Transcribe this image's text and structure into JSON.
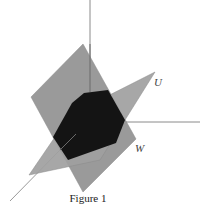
{
  "figure": {
    "caption": "Figure 1",
    "labels": {
      "plane_u": "U",
      "plane_w": "W"
    },
    "colors": {
      "background": "#ffffff",
      "plane": "#9a9a9a",
      "intersection": "#141414",
      "axis": "#8a8a8a"
    }
  }
}
